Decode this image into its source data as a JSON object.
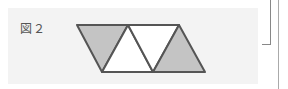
{
  "figure": {
    "label": "図２",
    "colors": {
      "shaded": "#c4c4c4",
      "unshaded": "#ffffff",
      "stroke": "#555555",
      "panel": "#f3f3f3"
    },
    "triangles": [
      {
        "orientation": "down",
        "shaded": true
      },
      {
        "orientation": "up",
        "shaded": false
      },
      {
        "orientation": "down",
        "shaded": false
      },
      {
        "orientation": "up",
        "shaded": true
      }
    ]
  }
}
